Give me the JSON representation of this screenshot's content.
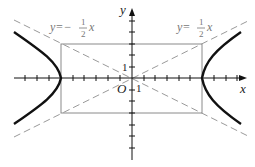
{
  "figure": {
    "type": "hyperbola-with-asymptotes",
    "equation_implied": "x^2/36 - y^2/9 = 1",
    "axes": {
      "x_label": "x",
      "y_label": "y",
      "origin_label": "O",
      "unit_x_label": "1",
      "unit_y_label": "1"
    },
    "asymptotes": [
      {
        "label_prefix": "y=−",
        "num": "1",
        "den": "2",
        "var": "x",
        "slope": -0.5
      },
      {
        "label_prefix": "y=",
        "num": "1",
        "den": "2",
        "var": "x",
        "slope": 0.5
      }
    ],
    "rectangle": {
      "x": [
        -6,
        6
      ],
      "y": [
        -3,
        3
      ]
    },
    "colors": {
      "curve": "#111111",
      "asymptote": "#999999",
      "rect": "#888888",
      "axis": "#111111"
    }
  }
}
